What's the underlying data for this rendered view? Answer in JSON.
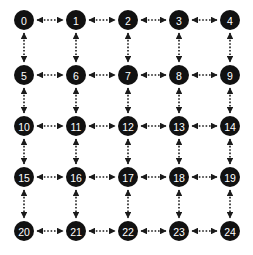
{
  "diagram": {
    "type": "grid-graph",
    "rows": 5,
    "cols": 5,
    "node_color": "#111111",
    "label_color": "#ffffff",
    "edge_color": "#1a1a1a",
    "edge_style": "dotted-bidirectional",
    "nodes": [
      {
        "id": 0,
        "label": "0",
        "row": 0,
        "col": 0
      },
      {
        "id": 1,
        "label": "1",
        "row": 0,
        "col": 1
      },
      {
        "id": 2,
        "label": "2",
        "row": 0,
        "col": 2
      },
      {
        "id": 3,
        "label": "3",
        "row": 0,
        "col": 3
      },
      {
        "id": 4,
        "label": "4",
        "row": 0,
        "col": 4
      },
      {
        "id": 5,
        "label": "5",
        "row": 1,
        "col": 0
      },
      {
        "id": 6,
        "label": "6",
        "row": 1,
        "col": 1
      },
      {
        "id": 7,
        "label": "7",
        "row": 1,
        "col": 2
      },
      {
        "id": 8,
        "label": "8",
        "row": 1,
        "col": 3
      },
      {
        "id": 9,
        "label": "9",
        "row": 1,
        "col": 4
      },
      {
        "id": 10,
        "label": "10",
        "row": 2,
        "col": 0
      },
      {
        "id": 11,
        "label": "11",
        "row": 2,
        "col": 1
      },
      {
        "id": 12,
        "label": "12",
        "row": 2,
        "col": 2
      },
      {
        "id": 13,
        "label": "13",
        "row": 2,
        "col": 3
      },
      {
        "id": 14,
        "label": "14",
        "row": 2,
        "col": 4
      },
      {
        "id": 15,
        "label": "15",
        "row": 3,
        "col": 0
      },
      {
        "id": 16,
        "label": "16",
        "row": 3,
        "col": 1
      },
      {
        "id": 17,
        "label": "17",
        "row": 3,
        "col": 2
      },
      {
        "id": 18,
        "label": "18",
        "row": 3,
        "col": 3
      },
      {
        "id": 19,
        "label": "19",
        "row": 3,
        "col": 4
      },
      {
        "id": 20,
        "label": "20",
        "row": 4,
        "col": 0
      },
      {
        "id": 21,
        "label": "21",
        "row": 4,
        "col": 1
      },
      {
        "id": 22,
        "label": "22",
        "row": 4,
        "col": 2
      },
      {
        "id": 23,
        "label": "23",
        "row": 4,
        "col": 3
      },
      {
        "id": 24,
        "label": "24",
        "row": 4,
        "col": 4
      }
    ],
    "edges": [
      [
        0,
        1
      ],
      [
        1,
        2
      ],
      [
        2,
        3
      ],
      [
        3,
        4
      ],
      [
        5,
        6
      ],
      [
        6,
        7
      ],
      [
        7,
        8
      ],
      [
        8,
        9
      ],
      [
        10,
        11
      ],
      [
        11,
        12
      ],
      [
        12,
        13
      ],
      [
        13,
        14
      ],
      [
        15,
        16
      ],
      [
        16,
        17
      ],
      [
        17,
        18
      ],
      [
        18,
        19
      ],
      [
        20,
        21
      ],
      [
        21,
        22
      ],
      [
        22,
        23
      ],
      [
        23,
        24
      ],
      [
        0,
        5
      ],
      [
        5,
        10
      ],
      [
        10,
        15
      ],
      [
        15,
        20
      ],
      [
        1,
        6
      ],
      [
        6,
        11
      ],
      [
        11,
        16
      ],
      [
        16,
        21
      ],
      [
        2,
        7
      ],
      [
        7,
        12
      ],
      [
        12,
        17
      ],
      [
        17,
        22
      ],
      [
        3,
        8
      ],
      [
        8,
        13
      ],
      [
        13,
        18
      ],
      [
        18,
        23
      ],
      [
        4,
        9
      ],
      [
        9,
        14
      ],
      [
        14,
        19
      ],
      [
        19,
        24
      ]
    ]
  }
}
